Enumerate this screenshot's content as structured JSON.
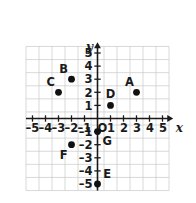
{
  "chart_data": {
    "type": "scatter",
    "title": "",
    "xlabel": "x",
    "ylabel": "y",
    "xlim": [
      -5.6,
      5.6
    ],
    "ylim": [
      -5.6,
      5.6
    ],
    "grid": true,
    "legend": "none",
    "origin_label": "O",
    "x_ticks": [
      -5,
      -4,
      -3,
      -2,
      -1,
      1,
      2,
      3,
      4,
      5
    ],
    "y_ticks": [
      5,
      4,
      3,
      2,
      1,
      -1,
      -2,
      -3,
      -4,
      -5
    ],
    "x_tick_labels": [
      "–5",
      "–4",
      "–3",
      "–2",
      "–1",
      "1",
      "2",
      "3",
      "4",
      "5"
    ],
    "y_tick_labels": [
      "5",
      "4",
      "3",
      "2",
      "1",
      "–1",
      "–2",
      "–3",
      "–4",
      "–5"
    ],
    "points": [
      {
        "label": "A",
        "x": 3,
        "y": 2,
        "label_dx": -0.55,
        "label_dy": 0.75
      },
      {
        "label": "B",
        "x": -2,
        "y": 3,
        "label_dx": -0.6,
        "label_dy": 0.75
      },
      {
        "label": "C",
        "x": -3,
        "y": 2,
        "label_dx": -0.6,
        "label_dy": 0.75
      },
      {
        "label": "D",
        "x": 1,
        "y": 1,
        "label_dx": 0.0,
        "label_dy": 0.85
      },
      {
        "label": "E",
        "x": 0,
        "y": -5,
        "label_dx": 0.75,
        "label_dy": 0.75
      },
      {
        "label": "F",
        "x": -2,
        "y": -2,
        "label_dx": -0.6,
        "label_dy": -0.75
      },
      {
        "label": "G",
        "x": 0,
        "y": -1,
        "label_dx": 0.75,
        "label_dy": -0.7
      }
    ]
  },
  "colors": {
    "background": "#ffffff",
    "grid": "#c9c9c9",
    "axis": "#1a1a1a",
    "point": "#111111",
    "text": "#1a1a1a"
  },
  "axes": {
    "x_name": "x",
    "y_name": "y"
  }
}
